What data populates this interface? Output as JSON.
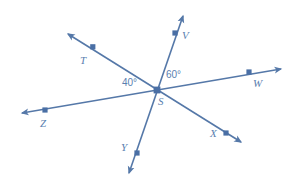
{
  "figure": {
    "background_color": "#ffffff",
    "stroke_color": "#5578a8",
    "label_color": "#5a7fb0",
    "vertex": {
      "label": "S",
      "x": 157,
      "y": 90
    },
    "points": [
      {
        "label": "T",
        "marker_x": 93,
        "marker_y": 47,
        "label_x": 80,
        "label_y": 55
      },
      {
        "label": "V",
        "marker_x": 175,
        "marker_y": 33,
        "label_x": 182,
        "label_y": 30
      },
      {
        "label": "W",
        "marker_x": 249,
        "marker_y": 72,
        "label_x": 253,
        "label_y": 78
      },
      {
        "label": "X",
        "marker_x": 226,
        "marker_y": 133,
        "label_x": 210,
        "label_y": 128
      },
      {
        "label": "Y",
        "marker_x": 137,
        "marker_y": 153,
        "label_x": 121,
        "label_y": 142
      },
      {
        "label": "Z",
        "marker_x": 45,
        "marker_y": 110,
        "label_x": 40,
        "label_y": 118
      }
    ],
    "lines": [
      {
        "name": "line-T-X",
        "from": "T",
        "to": "X",
        "x1": 68,
        "y1": 34,
        "x2": 241,
        "y2": 142
      },
      {
        "name": "line-V-Y",
        "from": "V",
        "to": "Y",
        "x1": 183,
        "y1": 16,
        "x2": 129,
        "y2": 173
      },
      {
        "name": "line-Z-W",
        "from": "Z",
        "to": "W",
        "x1": 22,
        "y1": 113,
        "x2": 281,
        "y2": 69
      }
    ],
    "angles": [
      {
        "name": "angle-TSZ",
        "value": "40°",
        "label_x": 122,
        "label_y": 78
      },
      {
        "name": "angle-VSW",
        "value": "60°",
        "label_x": 166,
        "label_y": 70
      }
    ]
  }
}
